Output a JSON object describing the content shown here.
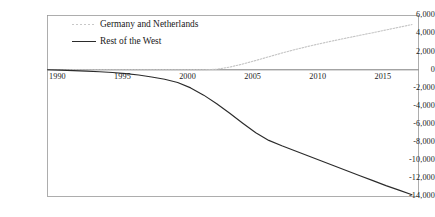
{
  "chart_data": {
    "type": "line",
    "title": "",
    "subtitle": "",
    "xlabel": "",
    "ylabel": "",
    "xlim": [
      1990,
      2018.5
    ],
    "ylim": [
      -14000,
      6000
    ],
    "grid": false,
    "legend_position": "top-center",
    "xticks": [
      "1990",
      "1995",
      "2000",
      "2005",
      "2010",
      "2015"
    ],
    "xtick_values": [
      1990,
      1995,
      2000,
      2005,
      2010,
      2015
    ],
    "yticks": [
      "6,000",
      "4,000",
      "2,000",
      "0",
      "-2,000",
      "-4,000",
      "-6,000",
      "-8,000",
      "-10,000",
      "-12,000",
      "-14,000"
    ],
    "ytick_values": [
      6000,
      4000,
      2000,
      0,
      -2000,
      -4000,
      -6000,
      -8000,
      -10000,
      -12000,
      -14000
    ],
    "zero_line": 0,
    "x": [
      1990,
      1991,
      1992,
      1993,
      1994,
      1995,
      1996,
      1997,
      1998,
      1999,
      2000,
      2001,
      2002,
      2003,
      2004,
      2005,
      2006,
      2007,
      2008,
      2009,
      2010,
      2011,
      2012,
      2013,
      2014,
      2015,
      2016,
      2017,
      2018
    ],
    "series": [
      {
        "name": "Germany and Netherlands",
        "style": "dotted",
        "color": "#c4c4c4",
        "values": [
          0,
          0,
          0,
          0,
          0,
          0,
          0,
          0,
          0,
          0,
          0,
          0,
          0,
          60,
          300,
          640,
          1030,
          1440,
          1850,
          2230,
          2580,
          2910,
          3220,
          3520,
          3810,
          4100,
          4400,
          4700,
          5000
        ]
      },
      {
        "name": "Rest of the West",
        "style": "solid",
        "color": "#2b2b2b",
        "values": [
          0,
          -40,
          -90,
          -150,
          -220,
          -300,
          -420,
          -580,
          -790,
          -1050,
          -1400,
          -2000,
          -2800,
          -3750,
          -4800,
          -5900,
          -6950,
          -7800,
          -8400,
          -8950,
          -9500,
          -10050,
          -10600,
          -11150,
          -11700,
          -12250,
          -12800,
          -13300,
          -13800
        ]
      }
    ]
  },
  "legend": {
    "entries": [
      {
        "label": "Germany and Netherlands",
        "style": "dotted"
      },
      {
        "label": "Rest of the West",
        "style": "solid"
      }
    ]
  },
  "axes": {
    "frame_color": "#9a9a9a",
    "zero_axis_color": "#6e6e6e"
  }
}
